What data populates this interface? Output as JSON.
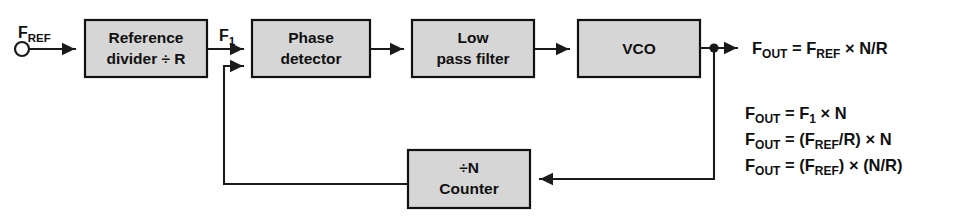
{
  "diagram": {
    "style": {
      "box_fill": "#d6d6d6",
      "box_stroke": "#111111",
      "wire_color": "#1a1a1a",
      "background": "#ffffff",
      "text_color": "#111111"
    },
    "blocks": [
      {
        "name": "reference-divider",
        "line1": "Reference",
        "line2": "divider ÷ R",
        "x": 85,
        "y": 20,
        "w": 122,
        "h": 57
      },
      {
        "name": "phase-detector",
        "line1": "Phase",
        "line2": "detector",
        "x": 252,
        "y": 20,
        "w": 118,
        "h": 57
      },
      {
        "name": "low-pass-filter",
        "line1": "Low",
        "line2": "pass filter",
        "x": 412,
        "y": 20,
        "w": 122,
        "h": 57
      },
      {
        "name": "vco",
        "line1": "VCO",
        "line2": "",
        "x": 578,
        "y": 20,
        "w": 122,
        "h": 57
      },
      {
        "name": "divide-n-counter",
        "line1": "÷N",
        "line2": "Counter",
        "x": 408,
        "y": 150,
        "w": 122,
        "h": 58
      }
    ],
    "port_labels": [
      {
        "name": "f-ref-label",
        "base": "F",
        "sub": "REF",
        "x": 18,
        "y": 24
      },
      {
        "name": "f1-label",
        "base": "F",
        "sub": "1",
        "x": 219,
        "y": 27
      }
    ],
    "input_terminal": {
      "name": "f-ref-terminal",
      "cx": 22,
      "cy": 49,
      "r": 7
    },
    "output_junction": {
      "name": "vco-output-junction",
      "cx": 714,
      "cy": 48,
      "r": 4.6
    },
    "equations": {
      "primary": {
        "name": "equation-fout-fref",
        "parts": [
          {
            "t": "F",
            "sub": false
          },
          {
            "t": "OUT",
            "sub": true
          },
          {
            "t": " = F",
            "sub": false
          },
          {
            "t": "REF",
            "sub": true
          },
          {
            "t": " × N/R",
            "sub": false
          }
        ],
        "x": 752,
        "y": 54
      },
      "secondary": [
        {
          "name": "equation-fout-f1-n",
          "parts": [
            {
              "t": "F",
              "sub": false
            },
            {
              "t": "OUT",
              "sub": true
            },
            {
              "t": " = F",
              "sub": false
            },
            {
              "t": "1",
              "sub": true
            },
            {
              "t": " × N",
              "sub": false
            }
          ],
          "x": 745,
          "y": 119
        },
        {
          "name": "equation-fout-frefr-n",
          "parts": [
            {
              "t": "F",
              "sub": false
            },
            {
              "t": "OUT",
              "sub": true
            },
            {
              "t": " = (F",
              "sub": false
            },
            {
              "t": "REF",
              "sub": true
            },
            {
              "t": "/R) × N",
              "sub": false
            }
          ],
          "x": 745,
          "y": 145
        },
        {
          "name": "equation-fout-fref-nr",
          "parts": [
            {
              "t": "F",
              "sub": false
            },
            {
              "t": "OUT",
              "sub": true
            },
            {
              "t": " = (F",
              "sub": false
            },
            {
              "t": "REF",
              "sub": true
            },
            {
              "t": ") × (N/R)",
              "sub": false
            }
          ],
          "x": 745,
          "y": 171
        }
      ]
    },
    "wires": [
      {
        "name": "wire-fref-to-divider",
        "d": "M 30 49 L 75 49"
      },
      {
        "name": "wire-divider-to-phase",
        "d": "M 207 49 L 243 49"
      },
      {
        "name": "wire-phase-to-lpf",
        "d": "M 370 49 L 403 49"
      },
      {
        "name": "wire-lpf-to-vco",
        "d": "M 534 49 L 569 49"
      },
      {
        "name": "wire-vco-to-output",
        "d": "M 700 48 L 737 48"
      },
      {
        "name": "wire-vco-down-to-counter",
        "d": "M 714 50 L 714 179 L 540 179"
      },
      {
        "name": "wire-counter-to-phase-feedback",
        "d": "M 408 184 L 224 184 L 224 66 L 243 66"
      }
    ],
    "arrow_heads": [
      {
        "name": "arrow-into-divider",
        "x": 75,
        "y": 49,
        "dir": "right"
      },
      {
        "name": "arrow-into-phase-top",
        "x": 243,
        "y": 49,
        "dir": "right"
      },
      {
        "name": "arrow-into-phase-bottom",
        "x": 243,
        "y": 66,
        "dir": "right"
      },
      {
        "name": "arrow-into-lpf",
        "x": 403,
        "y": 49,
        "dir": "right"
      },
      {
        "name": "arrow-into-vco",
        "x": 569,
        "y": 49,
        "dir": "right"
      },
      {
        "name": "arrow-to-fout",
        "x": 737,
        "y": 48,
        "dir": "right"
      },
      {
        "name": "arrow-into-counter-right",
        "x": 540,
        "y": 179,
        "dir": "left"
      }
    ]
  }
}
